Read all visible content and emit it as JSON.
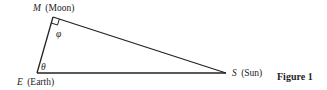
{
  "diagram": {
    "vertices": [
      {
        "id": "M",
        "symbol": "M",
        "name": "(Moon)"
      },
      {
        "id": "E",
        "symbol": "E",
        "name": "(Earth)"
      },
      {
        "id": "S",
        "symbol": "S",
        "name": "(Sun)"
      }
    ],
    "angles": {
      "at_moon": "φ",
      "at_earth": "θ",
      "right_angle_at": "M"
    },
    "caption": "Figure 1",
    "line_color": "#222222"
  }
}
